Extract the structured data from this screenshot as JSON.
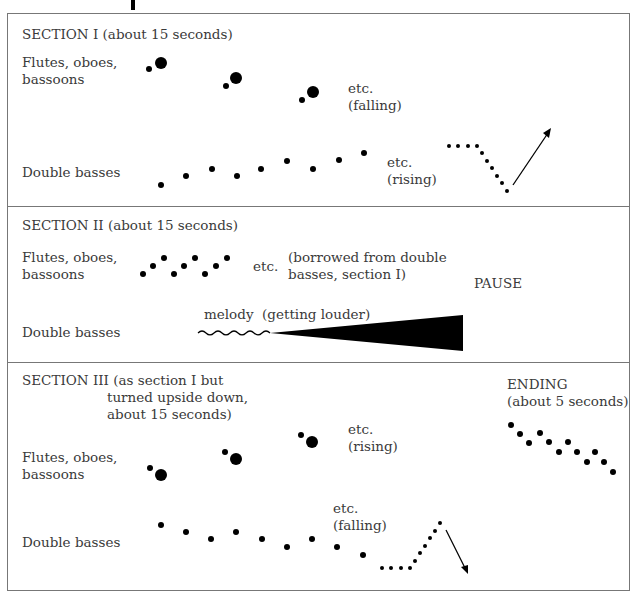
{
  "sections": [
    {
      "title": "SECTION I (about 15 seconds)",
      "upper_label": "Flutes, oboes,\nbassoons",
      "lower_label": "Double basses",
      "upper_note": "etc.\n(falling)",
      "lower_note": "etc.\n(rising)"
    },
    {
      "title": "SECTION II (about 15 seconds)",
      "upper_label": "Flutes, oboes,\nbassoons",
      "lower_label": "Double basses",
      "upper_etc": "etc.",
      "upper_note": "(borrowed from double\nbasses, section I)",
      "lower_note": "melody  (getting louder)",
      "pause": "PAUSE"
    },
    {
      "title": "SECTION III (as section I but",
      "title_cont": "turned upside down,\nabout 15 seconds)",
      "upper_label": "Flutes, oboes,\nbassoons",
      "lower_label": "Double basses",
      "upper_note": "etc.\n(rising)",
      "lower_note": "etc.\n(falling)",
      "ending": "ENDING\n(about 5 seconds)"
    }
  ],
  "colors": {
    "ink": "#000000",
    "border": "#777777",
    "text": "#3a3a3a"
  }
}
